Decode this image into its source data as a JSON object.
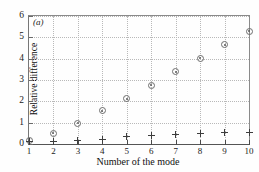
{
  "chart_data": {
    "type": "scatter",
    "title": "",
    "panel_label": "(a)",
    "xlabel": "Number of the mode",
    "ylabel": "Relative difference",
    "x": [
      1,
      2,
      3,
      4,
      5,
      6,
      7,
      8,
      9,
      10
    ],
    "xlim": [
      1,
      10
    ],
    "ylim": [
      0,
      6
    ],
    "xticks": [
      1,
      2,
      3,
      4,
      5,
      6,
      7,
      8,
      9,
      10
    ],
    "xtick_labels": [
      "1",
      "2",
      "3",
      "4",
      "5",
      "6",
      "7",
      "8",
      "9",
      "10"
    ],
    "yticks": [
      0,
      1,
      2,
      3,
      4,
      5,
      6
    ],
    "ytick_labels": [
      "0",
      "1",
      "2",
      "3",
      "4",
      "5",
      "6"
    ],
    "grid": true,
    "legend": "none",
    "series": [
      {
        "name": "diamond-series",
        "marker": "diamond",
        "values": [
          0.15,
          0.5,
          0.97,
          1.55,
          2.13,
          2.75,
          3.38,
          4.02,
          4.65,
          5.28
        ]
      },
      {
        "name": "plus-series",
        "marker": "plus",
        "values": [
          0.1,
          0.12,
          0.15,
          0.22,
          0.33,
          0.4,
          0.46,
          0.5,
          0.53,
          0.55
        ]
      }
    ]
  }
}
